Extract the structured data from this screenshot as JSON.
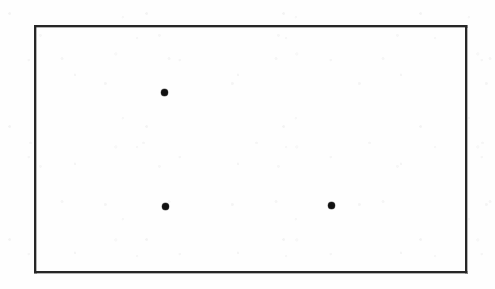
{
  "figure": {
    "type": "scanned-diagram",
    "canvas": {
      "width": 495,
      "height": 289,
      "background_color": "#fefefe"
    },
    "frame": {
      "label": "rectangular-border",
      "x": 34,
      "y": 25,
      "width": 433,
      "height": 248,
      "border_width": 2,
      "border_color": "#262626"
    },
    "points": {
      "count": 3,
      "color": "#111111",
      "diameter": 7,
      "items": [
        {
          "label": "point-top",
          "x": 164,
          "y": 92
        },
        {
          "label": "point-bottom-left",
          "x": 165,
          "y": 206
        },
        {
          "label": "point-bottom-right",
          "x": 331,
          "y": 205
        }
      ]
    }
  },
  "chart_data": {
    "type": "scatter",
    "title": "",
    "subtitle": "",
    "xlabel": "",
    "ylabel": "",
    "grid": false,
    "legend": null,
    "axis_ticks": {
      "x": [],
      "y": []
    },
    "annotations": [],
    "note": "Three filled black dots inside a plain rectangular frame; no axes, labels, ticks, or legend are printed. Values below are pixel coordinates measured from the top-left of the image.",
    "xlim": [
      34,
      467
    ],
    "ylim": [
      273,
      25
    ],
    "series": [
      {
        "name": "points",
        "marker": "filled-circle",
        "color": "#111111",
        "x": [
          164,
          165,
          331
        ],
        "y": [
          92,
          206,
          205
        ]
      }
    ]
  }
}
